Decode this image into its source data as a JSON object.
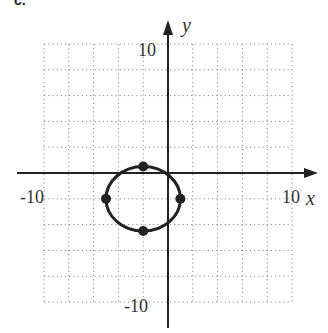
{
  "problem_label": "c.",
  "chart_data": {
    "type": "line",
    "title": "",
    "xlabel": "x",
    "ylabel": "y",
    "xlim": [
      -10,
      10
    ],
    "ylim": [
      -10,
      10
    ],
    "grid": true,
    "grid_step": 2,
    "tick_labels": {
      "x": [
        "-10",
        "10"
      ],
      "y": [
        "10",
        "-10"
      ]
    },
    "series": [
      {
        "name": "ellipse",
        "shape": "ellipse",
        "center": [
          -2,
          -2
        ],
        "semi_axis_x": 3,
        "semi_axis_y": 2.5,
        "marked_points": [
          [
            -2,
            0.5
          ],
          [
            -5,
            -2
          ],
          [
            1,
            -2
          ],
          [
            -2,
            -4.5
          ]
        ]
      }
    ],
    "colors": {
      "curve": "#222222",
      "grid": "#888888",
      "axis": "#222222"
    }
  }
}
